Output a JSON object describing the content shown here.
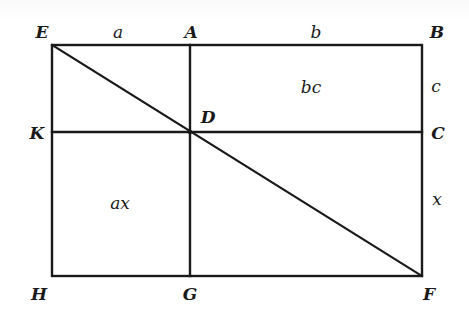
{
  "figure": {
    "type": "geometric-diagram",
    "stroke_color": "#1a1a1a",
    "background": "#ffffff"
  },
  "points": {
    "E": {
      "label": "E",
      "x": 52,
      "y": 45
    },
    "A": {
      "label": "A",
      "x": 190,
      "y": 45
    },
    "B": {
      "label": "B",
      "x": 422,
      "y": 45
    },
    "K": {
      "label": "K",
      "x": 52,
      "y": 132
    },
    "D": {
      "label": "D",
      "x": 190,
      "y": 132
    },
    "C": {
      "label": "C",
      "x": 422,
      "y": 132
    },
    "H": {
      "label": "H",
      "x": 52,
      "y": 276
    },
    "G": {
      "label": "G",
      "x": 190,
      "y": 276
    },
    "F": {
      "label": "F",
      "x": 422,
      "y": 276
    }
  },
  "segments": [
    {
      "from": "E",
      "to": "B"
    },
    {
      "from": "B",
      "to": "F"
    },
    {
      "from": "F",
      "to": "H"
    },
    {
      "from": "H",
      "to": "E"
    },
    {
      "from": "A",
      "to": "G"
    },
    {
      "from": "K",
      "to": "C"
    },
    {
      "from": "E",
      "to": "F"
    }
  ],
  "labels": {
    "point_E": "E",
    "point_A": "A",
    "point_B": "B",
    "point_K": "K",
    "point_D": "D",
    "point_C": "C",
    "point_H": "H",
    "point_G": "G",
    "point_F": "F",
    "length_a": "a",
    "length_b": "b",
    "length_c": "c",
    "length_x": "x",
    "area_bc": "bc",
    "area_ax": "ax"
  }
}
